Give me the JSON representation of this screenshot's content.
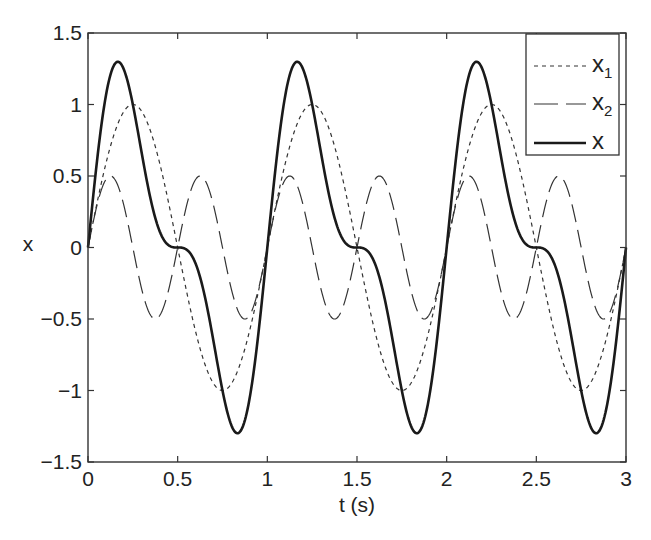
{
  "chart_data": {
    "type": "line",
    "title": "",
    "xlabel": "t (s)",
    "ylabel": "x",
    "xlim": [
      0,
      3
    ],
    "ylim": [
      -1.5,
      1.5
    ],
    "grid": false,
    "legend_position": "upper right",
    "xticks": [
      0,
      0.5,
      1,
      1.5,
      2,
      2.5,
      3
    ],
    "xtick_labels": [
      "0",
      "0.5",
      "1",
      "1.5",
      "2",
      "2.5",
      "3"
    ],
    "yticks": [
      -1.5,
      -1,
      -0.5,
      0,
      0.5,
      1,
      1.5
    ],
    "ytick_labels": [
      "−1.5",
      "−1",
      "−0.5",
      "0",
      "0.5",
      "1",
      "1.5"
    ],
    "series": [
      {
        "name": "x1",
        "label_base": "x",
        "label_sub": "1",
        "style": "dotted",
        "linewidth": 1.2,
        "color": "#333333",
        "formula": "sin(2*pi*t)",
        "x": [
          0,
          0.125,
          0.25,
          0.375,
          0.5,
          0.625,
          0.75,
          0.875,
          1.0,
          1.125,
          1.25,
          1.375,
          1.5,
          1.625,
          1.75,
          1.875,
          2.0,
          2.125,
          2.25,
          2.375,
          2.5,
          2.625,
          2.75,
          2.875,
          3.0
        ],
        "values": [
          0,
          0.71,
          1.0,
          0.71,
          0,
          -0.71,
          -1.0,
          -0.71,
          0,
          0.71,
          1.0,
          0.71,
          0,
          -0.71,
          -1.0,
          -0.71,
          0,
          0.71,
          1.0,
          0.71,
          0,
          -0.71,
          -1.0,
          -0.71,
          0
        ]
      },
      {
        "name": "x2",
        "label_base": "x",
        "label_sub": "2",
        "style": "dashed",
        "linewidth": 1.2,
        "color": "#333333",
        "formula": "0.5*sin(4*pi*t)",
        "x": [
          0,
          0.125,
          0.25,
          0.375,
          0.5,
          0.625,
          0.75,
          0.875,
          1.0,
          1.125,
          1.25,
          1.375,
          1.5,
          1.625,
          1.75,
          1.875,
          2.0,
          2.125,
          2.25,
          2.375,
          2.5,
          2.625,
          2.75,
          2.875,
          3.0
        ],
        "values": [
          0,
          0.5,
          0,
          -0.5,
          0,
          0.5,
          0,
          -0.5,
          0,
          0.5,
          0,
          -0.5,
          0,
          0.5,
          0,
          -0.5,
          0,
          0.5,
          0,
          -0.5,
          0,
          0.5,
          0,
          -0.5,
          0
        ]
      },
      {
        "name": "x",
        "label_base": "x",
        "label_sub": "",
        "style": "solid",
        "linewidth": 2.6,
        "color": "#1a1a1a",
        "formula": "x1 + x2",
        "x": [
          0,
          0.125,
          0.25,
          0.375,
          0.5,
          0.625,
          0.75,
          0.875,
          1.0,
          1.125,
          1.25,
          1.375,
          1.5,
          1.625,
          1.75,
          1.875,
          2.0,
          2.125,
          2.25,
          2.375,
          2.5,
          2.625,
          2.75,
          2.875,
          3.0
        ],
        "values": [
          0,
          1.21,
          1.0,
          0.21,
          0,
          -0.21,
          -1.0,
          -1.21,
          0,
          1.21,
          1.0,
          0.21,
          0,
          -0.21,
          -1.0,
          -1.21,
          0,
          1.21,
          1.0,
          0.21,
          0,
          -0.21,
          -1.0,
          -1.21,
          0
        ],
        "peak_value": 1.3,
        "trough_value": -1.3
      }
    ]
  }
}
